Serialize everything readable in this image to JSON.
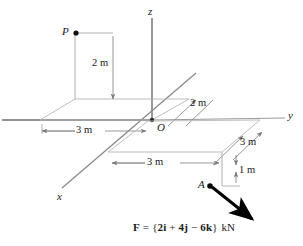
{
  "figure": {
    "type": "engineering-statics-3d-coordinate-diagram",
    "axes": {
      "z_label": "z",
      "x_label": "x",
      "y_label": "y"
    },
    "points": {
      "origin": "O",
      "upper_point": "P",
      "force_point": "A"
    },
    "dimensions": {
      "p_height": "2 m",
      "p_horizontal": "3 m",
      "o_diagonal": "2 m",
      "a_horizontal": "3 m",
      "a_diagonal": "3 m",
      "a_drop": "1 m"
    },
    "force_equation": {
      "symbol": "F",
      "equals": "=",
      "open_brace": "{",
      "term_i": "2i",
      "plus_1": "+",
      "term_j": "4j",
      "minus": "−",
      "term_k": "6k",
      "close_brace": "}",
      "units": "kN",
      "full_text": "F = {2i + 4j − 6k} kN"
    },
    "colors": {
      "line": "#8a8a8a",
      "axis": "#6e6e6e",
      "text": "#1a1a1a",
      "force_arrow": "#000000"
    }
  }
}
